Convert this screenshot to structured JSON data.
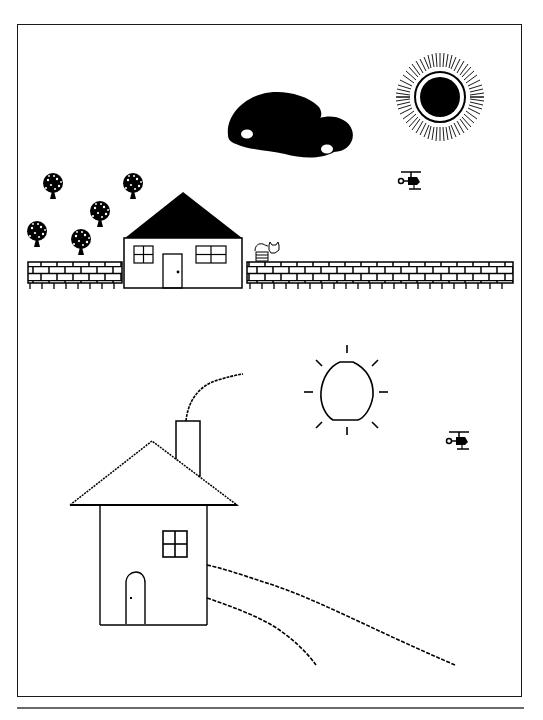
{
  "document": {
    "description": "Two black-and-white bitmap drawings of a landscape with a house",
    "panels": [
      {
        "name": "upper-scene",
        "elements": [
          "cloud",
          "sun-with-rays",
          "helicopter",
          "trees",
          "house-with-black-roof",
          "cat",
          "brick-wall"
        ]
      },
      {
        "name": "lower-scene",
        "elements": [
          "outline-sun",
          "helicopter",
          "house-with-chimney",
          "smoke",
          "path"
        ]
      }
    ]
  },
  "colors": {
    "ink": "#000000",
    "paper": "#ffffff",
    "frame": "#1a1a1a",
    "separator": "#6a6a6a"
  }
}
